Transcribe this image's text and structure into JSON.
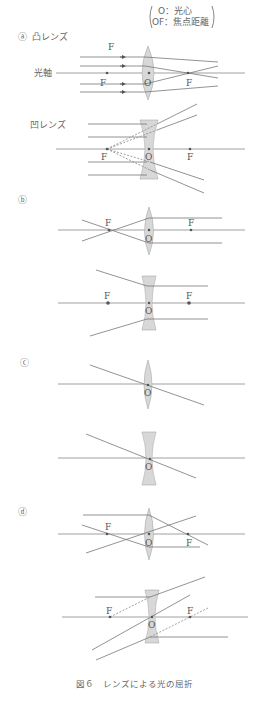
{
  "legend": {
    "line1": "O：光心",
    "line2": "OF：焦点距離"
  },
  "sections": {
    "a": {
      "marker": "ⓐ",
      "convex_title": "凸レンズ",
      "axis_label": "光軸",
      "concave_title": "凹レンズ"
    },
    "b": {
      "marker": "ⓑ"
    },
    "c": {
      "marker": "ⓒ"
    },
    "d": {
      "marker": "ⓓ"
    }
  },
  "labels": {
    "focus": "F",
    "center": "O"
  },
  "caption": "図６　レンズによる光の屈折",
  "colors": {
    "ray": "#777777",
    "lens_fill": "#d8d8d8",
    "lens_edge": "#bdbdbd"
  }
}
